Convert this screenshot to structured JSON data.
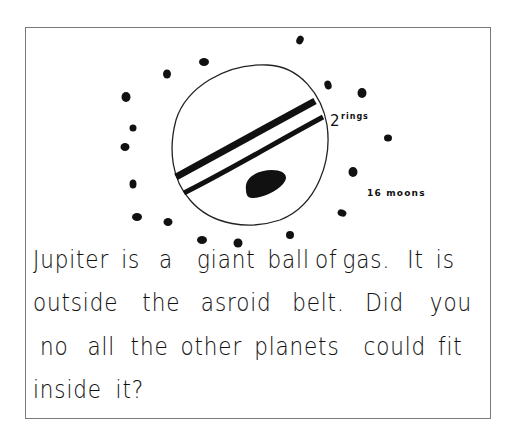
{
  "drawing": {
    "subject": "Jupiter",
    "colors": {
      "ink": "#111111",
      "frame": "#7a7a7a",
      "background": "#ffffff"
    },
    "annotations": {
      "rings_count": "2",
      "rings_word": "rings",
      "moons_label": "16 moons"
    }
  },
  "text": {
    "lines": [
      {
        "words": [
          "Jupiter",
          "is",
          "a",
          "giant",
          "ball",
          "of",
          "gas.",
          "It",
          "is"
        ]
      },
      {
        "words": [
          "outside",
          "the",
          "asroid",
          "belt.",
          "Did",
          "you"
        ]
      },
      {
        "words": [
          "no",
          "all",
          "the",
          "other",
          "planets",
          "could",
          "fit"
        ]
      },
      {
        "words": [
          "inside",
          "it?"
        ]
      }
    ]
  }
}
